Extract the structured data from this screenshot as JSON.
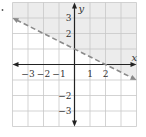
{
  "figure": {
    "type": "linear-inequality-graph",
    "boundary": {
      "slope": -0.5,
      "intercept": 1,
      "style": "dashed",
      "color": "#8a8a8a"
    },
    "shading": {
      "region": "above",
      "color": "#ececec"
    },
    "x_range": [
      -4,
      4
    ],
    "y_range": [
      -4,
      4
    ],
    "axes": {
      "x_label": "x",
      "y_label": "y"
    },
    "x_ticks": [
      {
        "value": -3,
        "label": "−3"
      },
      {
        "value": -2,
        "label": "−2"
      },
      {
        "value": -1,
        "label": "−1"
      },
      {
        "value": 1,
        "label": "1"
      },
      {
        "value": 2,
        "label": "2"
      }
    ],
    "y_ticks": [
      {
        "value": 3,
        "label": "3"
      },
      {
        "value": 2,
        "label": "2"
      },
      {
        "value": -2,
        "label": "−2"
      },
      {
        "value": -3,
        "label": "−3"
      }
    ],
    "colors": {
      "grid": "#c8c8c8",
      "axis": "#222222"
    }
  }
}
